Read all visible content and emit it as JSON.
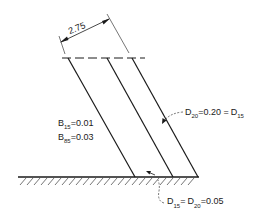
{
  "diagram": {
    "dimension": {
      "label": "2.75"
    },
    "left_labels": {
      "b15": {
        "sym": "B",
        "sub": "15",
        "eq": "=0.01"
      },
      "b85": {
        "sym": "B",
        "sub": "85",
        "eq": "=0.03"
      }
    },
    "right_label": {
      "d20_sym": "D",
      "d20_sub": "20",
      "mid": "=0.20 =",
      "d15_sym": "D",
      "d15_sub": "15"
    },
    "bottom_label": {
      "d15_sym": "D",
      "d15_sub": "15",
      "eq1": "=",
      "d20_sym": "D",
      "d20_sub": "20",
      "eq2": "=0.05"
    },
    "colors": {
      "line": "#1a1a1a",
      "background": "#ffffff"
    }
  }
}
